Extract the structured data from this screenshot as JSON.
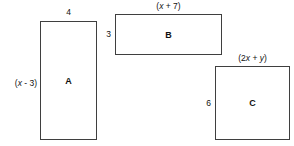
{
  "figure": {
    "type": "geometry-diagram",
    "background_color": "#ffffff",
    "line_color": "#3f3f3f",
    "text_color": "#111111"
  },
  "shapes": [
    {
      "id": "A",
      "label": "A",
      "top_dimension": "4",
      "left_dimension": "(x - 3)",
      "left_dimension_parts": {
        "prefix": "(",
        "variable": "x",
        "operator": " - ",
        "value": "3",
        "suffix": ")"
      }
    },
    {
      "id": "B",
      "label": "B",
      "top_dimension": "(x + 7)",
      "top_dimension_parts": {
        "prefix": "(",
        "variable": "x",
        "operator": " + ",
        "value": "7",
        "suffix": ")"
      },
      "left_dimension": "3"
    },
    {
      "id": "C",
      "label": "C",
      "top_dimension": "(2x + y)",
      "top_dimension_parts": {
        "prefix": "(2",
        "variable": "x",
        "operator": " + ",
        "variable2": "y",
        "suffix": ")"
      },
      "left_dimension": "6"
    }
  ]
}
